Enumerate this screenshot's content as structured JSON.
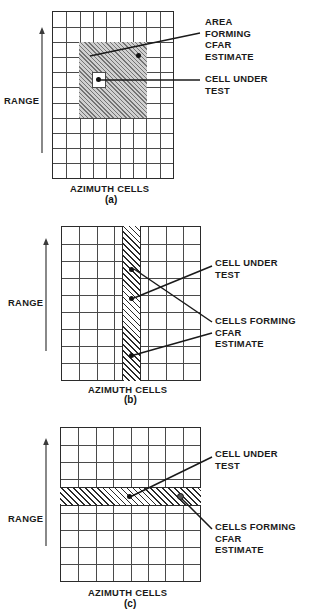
{
  "figure": {
    "axis_range_label": "RANGE",
    "axis_azimuth_label": "AZIMUTH CELLS"
  },
  "panels": [
    {
      "id": "a",
      "caption": "(a)",
      "range_label": "RANGE",
      "azimuth_label": "AZIMUTH CELLS",
      "grid": {
        "cols": 9,
        "rows": 11
      },
      "shaded": {
        "type": "area",
        "col_start": 2,
        "col_end": 7,
        "row_start": 2,
        "row_end": 7
      },
      "cell_under_test": {
        "col": 4,
        "row": 4
      },
      "labels": [
        {
          "name": "area-forming-cfar-estimate",
          "text": "AREA\nFORMING\nCFAR\nESTIMATE"
        },
        {
          "name": "cell-under-test",
          "text": "CELL UNDER\nTEST"
        }
      ]
    },
    {
      "id": "b",
      "caption": "(b)",
      "range_label": "RANGE",
      "azimuth_label": "AZIMUTH CELLS",
      "grid": {
        "cols": 8,
        "rows": 9
      },
      "shaded": {
        "type": "column",
        "col_index": 4
      },
      "cell_under_test": {
        "col": 4,
        "row": 4
      },
      "labels": [
        {
          "name": "cell-under-test",
          "text": "CELL UNDER\nTEST"
        },
        {
          "name": "cells-forming-cfar-estimate",
          "text": "CELLS FORMING\nCFAR\nESTIMATE"
        }
      ]
    },
    {
      "id": "c",
      "caption": "(c)",
      "range_label": "RANGE",
      "azimuth_label": "AZIMUTH CELLS",
      "grid": {
        "cols": 8,
        "rows": 9
      },
      "shaded": {
        "type": "row",
        "row_index": 4
      },
      "cell_under_test": {
        "col": 4,
        "row": 4
      },
      "labels": [
        {
          "name": "cell-under-test",
          "text": "CELL UNDER\nTEST"
        },
        {
          "name": "cells-forming-cfar-estimate",
          "text": "CELLS FORMING\nCFAR\nESTIMATE"
        }
      ]
    }
  ],
  "chart_data": {
    "type": "diagram",
    "subplots": [
      {
        "label": "(a)",
        "description": "Two-dimensional block of range-azimuth cells forming the CFAR estimate with the cell under test excluded at the center",
        "grid_cols": 9,
        "grid_rows": 11,
        "reference_region": "5x5 block of cells, rows 3-7, columns 3-7",
        "cell_under_test_position": [
          5,
          5
        ],
        "annotations": [
          "AREA FORMING CFAR ESTIMATE",
          "CELL UNDER TEST"
        ]
      },
      {
        "label": "(b)",
        "description": "One-dimensional column of range cells in a single azimuth bin forming the CFAR estimate",
        "grid_cols": 8,
        "grid_rows": 9,
        "reference_region": "single azimuth column, column 4, all rows",
        "cell_under_test_position": [
          4,
          4
        ],
        "annotations": [
          "CELL UNDER TEST",
          "CELLS FORMING CFAR ESTIMATE"
        ]
      },
      {
        "label": "(c)",
        "description": "One-dimensional row of azimuth cells at a single range bin forming the CFAR estimate",
        "grid_cols": 8,
        "grid_rows": 9,
        "reference_region": "single range row, row 4, all columns",
        "cell_under_test_position": [
          4,
          4
        ],
        "annotations": [
          "CELL UNDER TEST",
          "CELLS FORMING CFAR ESTIMATE"
        ]
      }
    ],
    "xlabel": "AZIMUTH CELLS",
    "ylabel": "RANGE",
    "grid": true,
    "legend": "none"
  },
  "colors": {
    "ink": "#1a1a1a",
    "grid_line": "#4a4a4a",
    "border": "#2b2b2b",
    "hatch": "#d0d0d0",
    "background": "#ffffff"
  }
}
